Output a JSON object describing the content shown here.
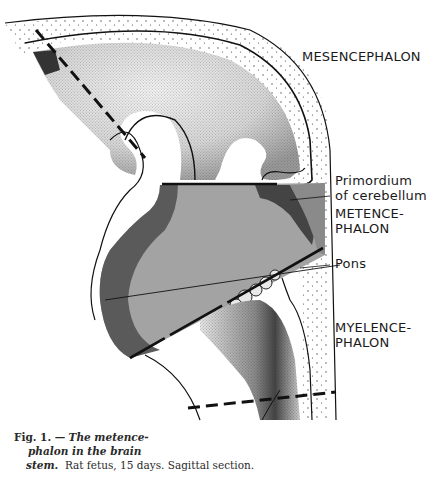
{
  "figure": {
    "labels": {
      "mesencephalon": "MESENCEPHALON",
      "primordium_line1": "Primordium",
      "primordium_line2": "of cerebellum",
      "metencephalon_line1": "METENCE-",
      "metencephalon_line2": "PHALON",
      "pons": "Pons",
      "myelencephalon_line1": "MYELENCE-",
      "myelencephalon_line2": "PHALON"
    },
    "caption": {
      "fig_number": "Fig. 1. —",
      "title_line1": "The metence-",
      "title_line2": "phalon in the brain",
      "title_line3": "stem.",
      "description": "Rat fetus, 15 days.  Sagittal section."
    },
    "colors": {
      "background": "#ffffff",
      "ink": "#111111",
      "metencephalon_fill": "#a3a3a3",
      "dark_wall": "#555555",
      "stipple": "#2b2b2b"
    }
  }
}
